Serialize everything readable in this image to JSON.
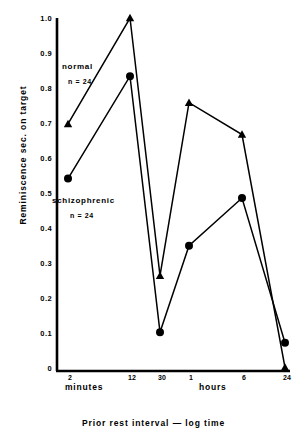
{
  "chart_data": {
    "type": "line",
    "title": "",
    "xlabel": "Prior rest interval — log time",
    "ylabel": "Reminiscence sec. on target",
    "categories": [
      "2",
      "12",
      "30",
      "1",
      "6",
      "24"
    ],
    "x_tick_labels": [
      "2",
      "12",
      "30",
      "1",
      "6",
      "24"
    ],
    "x_group_labels": [
      "minutes",
      "hours"
    ],
    "y_tick_labels": [
      "0",
      "0.1",
      "0.2",
      "0.3",
      "0.4",
      "0.5",
      "0.6",
      "0.7",
      "0.8",
      "0.9",
      "1.0"
    ],
    "ylim": [
      0,
      1.0
    ],
    "grid": false,
    "legend_position": "inside-plot",
    "series": [
      {
        "name": "normal",
        "n_label": "n = 24",
        "marker": "triangle",
        "values": [
          0.7,
          1.0,
          0.27,
          0.76,
          0.67,
          0.01
        ]
      },
      {
        "name": "schizophrenic",
        "n_label": "n = 24",
        "marker": "circle",
        "values": [
          0.545,
          0.835,
          0.11,
          0.355,
          0.49,
          0.08
        ]
      }
    ],
    "colors": {
      "line": "#000000",
      "axis": "#000000",
      "background": "#ffffff"
    }
  },
  "annotations": {
    "normal_label": "normal",
    "normal_n": "n = 24",
    "schizophrenic_label": "schizophrenic",
    "schizophrenic_n": "n = 24"
  }
}
